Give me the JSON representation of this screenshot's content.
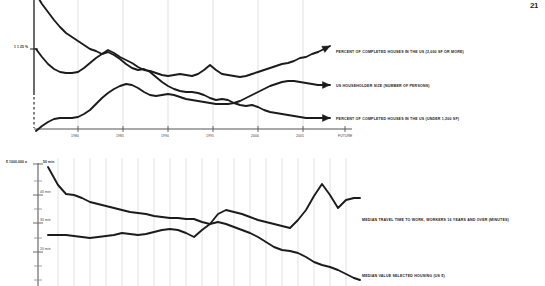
{
  "page": {
    "corner_mark": "21",
    "background": "#ffffff",
    "ink": "#1b1b1b",
    "grid_color": "#cfcfcf"
  },
  "chart_data": [
    {
      "id": "top",
      "type": "line",
      "title": "",
      "xlabel": "",
      "ylabel": "",
      "grid": true,
      "legend_position": "right",
      "axis": {
        "y_note": "1 1 25 %",
        "x_ticks": [
          "1980",
          "1985",
          "1990",
          "1995",
          "2000",
          "2005",
          "FUTURE"
        ],
        "x_tick_positions": [
          78,
          123,
          168,
          213,
          258,
          303,
          345
        ],
        "x_range": [
          34,
          352
        ],
        "y_range": [
          0,
          132
        ],
        "gridline_x": [
          78,
          123,
          168,
          213,
          258,
          303
        ]
      },
      "series": [
        {
          "name": "PERCENT OF COMPLETED HOUSES IN THE US (2,000 SF OR MORE)",
          "legend_y": 51,
          "points": [
            [
              36,
              -6
            ],
            [
              42,
              4
            ],
            [
              48,
              12
            ],
            [
              54,
              20
            ],
            [
              60,
              27
            ],
            [
              66,
              33
            ],
            [
              72,
              37
            ],
            [
              78,
              41
            ],
            [
              84,
              45
            ],
            [
              90,
              49
            ],
            [
              96,
              51
            ],
            [
              102,
              54
            ],
            [
              108,
              50
            ],
            [
              114,
              53
            ],
            [
              120,
              57
            ],
            [
              126,
              60
            ],
            [
              132,
              63
            ],
            [
              138,
              67
            ],
            [
              144,
              70
            ],
            [
              150,
              71
            ],
            [
              156,
              73
            ],
            [
              162,
              75
            ],
            [
              168,
              76
            ],
            [
              174,
              75
            ],
            [
              180,
              74
            ],
            [
              186,
              75
            ],
            [
              192,
              76
            ],
            [
              198,
              74
            ],
            [
              204,
              70
            ],
            [
              210,
              65
            ],
            [
              216,
              70
            ],
            [
              222,
              74
            ],
            [
              228,
              75
            ],
            [
              234,
              76
            ],
            [
              240,
              77
            ],
            [
              246,
              76
            ],
            [
              252,
              74
            ],
            [
              258,
              72
            ],
            [
              264,
              70
            ],
            [
              270,
              68
            ],
            [
              276,
              66
            ],
            [
              282,
              64
            ],
            [
              288,
              63
            ],
            [
              294,
              61
            ],
            [
              300,
              58
            ],
            [
              306,
              57
            ],
            [
              312,
              54
            ],
            [
              318,
              52
            ]
          ],
          "arrow_at": [
            330,
            46
          ]
        },
        {
          "name": "US HOUSEHOLDER SIZE (NUMBER OF PERSONS)",
          "legend_y": 85,
          "points": [
            [
              36,
              131
            ],
            [
              42,
              126
            ],
            [
              48,
              122
            ],
            [
              54,
              119
            ],
            [
              60,
              118
            ],
            [
              66,
              118
            ],
            [
              72,
              118
            ],
            [
              78,
              117
            ],
            [
              84,
              114
            ],
            [
              90,
              110
            ],
            [
              96,
              104
            ],
            [
              102,
              98
            ],
            [
              108,
              93
            ],
            [
              114,
              89
            ],
            [
              120,
              86
            ],
            [
              126,
              84
            ],
            [
              132,
              85
            ],
            [
              138,
              88
            ],
            [
              144,
              92
            ],
            [
              150,
              95
            ],
            [
              156,
              96
            ],
            [
              162,
              95
            ],
            [
              168,
              94
            ],
            [
              174,
              95
            ],
            [
              180,
              97
            ],
            [
              186,
              99
            ],
            [
              192,
              100
            ],
            [
              198,
              101
            ],
            [
              204,
              102
            ],
            [
              210,
              103
            ],
            [
              216,
              104
            ],
            [
              222,
              104
            ],
            [
              228,
              104
            ],
            [
              234,
              103
            ],
            [
              240,
              101
            ],
            [
              246,
              98
            ],
            [
              252,
              95
            ],
            [
              258,
              92
            ],
            [
              264,
              89
            ],
            [
              270,
              86
            ],
            [
              276,
              84
            ],
            [
              282,
              82
            ],
            [
              288,
              81
            ],
            [
              294,
              81
            ],
            [
              300,
              82
            ],
            [
              306,
              83
            ],
            [
              312,
              84
            ],
            [
              318,
              85
            ]
          ],
          "arrow_at": [
            330,
            85
          ]
        },
        {
          "name": "PERCENT OF COMPLETED HOUSES IN THE US (UNDER 1,200 SF)",
          "legend_y": 118,
          "points": [
            [
              36,
              49
            ],
            [
              42,
              57
            ],
            [
              48,
              64
            ],
            [
              54,
              69
            ],
            [
              60,
              72
            ],
            [
              66,
              73
            ],
            [
              72,
              73
            ],
            [
              78,
              72
            ],
            [
              84,
              68
            ],
            [
              90,
              63
            ],
            [
              96,
              58
            ],
            [
              102,
              54
            ],
            [
              108,
              52
            ],
            [
              114,
              55
            ],
            [
              120,
              59
            ],
            [
              126,
              64
            ],
            [
              132,
              68
            ],
            [
              138,
              70
            ],
            [
              144,
              69
            ],
            [
              150,
              72
            ],
            [
              156,
              77
            ],
            [
              162,
              82
            ],
            [
              168,
              86
            ],
            [
              174,
              89
            ],
            [
              180,
              91
            ],
            [
              186,
              92
            ],
            [
              192,
              92
            ],
            [
              198,
              93
            ],
            [
              204,
              95
            ],
            [
              210,
              98
            ],
            [
              216,
              100
            ],
            [
              222,
              99
            ],
            [
              228,
              100
            ],
            [
              234,
              103
            ],
            [
              240,
              105
            ],
            [
              246,
              106
            ],
            [
              252,
              105
            ],
            [
              258,
              107
            ],
            [
              264,
              110
            ],
            [
              270,
              112
            ],
            [
              276,
              113
            ],
            [
              282,
              114
            ],
            [
              288,
              115
            ],
            [
              294,
              116
            ],
            [
              300,
              117
            ],
            [
              306,
              118
            ],
            [
              312,
              118
            ],
            [
              318,
              118
            ]
          ],
          "arrow_at": [
            330,
            118
          ]
        }
      ]
    },
    {
      "id": "bottom",
      "type": "line",
      "title": "",
      "xlabel": "",
      "ylabel": "",
      "grid": true,
      "legend_position": "right",
      "axis": {
        "y_note_left": "$ 1000,000 a",
        "y_note_right": "50 min",
        "y_ticks": [
          "40 min",
          "30 min",
          "20 min"
        ],
        "y_tick_positions": [
          45,
          73,
          102
        ],
        "y_minor_positions": [
          31,
          59,
          88,
          116,
          130
        ],
        "x_range": [
          38,
          360
        ],
        "y_range": [
          14,
          136
        ],
        "gridline_x": [
          58,
          74,
          90,
          106,
          122,
          138,
          154,
          170,
          186,
          202,
          218,
          234,
          250,
          266,
          282,
          298,
          314,
          330,
          346
        ]
      },
      "series": [
        {
          "name": "MEDIAN TRAVEL TIME TO WORK, WORKERS 16 YEARS AND OVER (MINUTES)",
          "legend_y": 219,
          "points": [
            [
              48,
              17
            ],
            [
              58,
              35
            ],
            [
              66,
              44
            ],
            [
              74,
              45
            ],
            [
              82,
              48
            ],
            [
              90,
              52
            ],
            [
              98,
              54
            ],
            [
              106,
              56
            ],
            [
              114,
              58
            ],
            [
              122,
              60
            ],
            [
              130,
              62
            ],
            [
              138,
              63
            ],
            [
              146,
              64
            ],
            [
              154,
              66
            ],
            [
              162,
              67
            ],
            [
              170,
              68
            ],
            [
              178,
              68
            ],
            [
              186,
              69
            ],
            [
              194,
              69
            ],
            [
              202,
              72
            ],
            [
              210,
              74
            ],
            [
              218,
              64
            ],
            [
              226,
              60
            ],
            [
              234,
              62
            ],
            [
              242,
              64
            ],
            [
              250,
              67
            ],
            [
              258,
              70
            ],
            [
              266,
              72
            ],
            [
              274,
              74
            ],
            [
              282,
              76
            ],
            [
              290,
              78
            ],
            [
              298,
              70
            ],
            [
              306,
              60
            ],
            [
              314,
              46
            ],
            [
              322,
              34
            ],
            [
              330,
              45
            ],
            [
              338,
              58
            ],
            [
              346,
              50
            ],
            [
              354,
              48
            ]
          ],
          "arrow_at": [
            360,
            48
          ]
        },
        {
          "name": "MEDIAN VALUE SELECTED HOUSING (US $)",
          "legend_y": 275,
          "points": [
            [
              48,
              85
            ],
            [
              58,
              85
            ],
            [
              66,
              85
            ],
            [
              74,
              86
            ],
            [
              82,
              87
            ],
            [
              90,
              88
            ],
            [
              98,
              87
            ],
            [
              106,
              86
            ],
            [
              114,
              85
            ],
            [
              122,
              83
            ],
            [
              130,
              84
            ],
            [
              138,
              85
            ],
            [
              146,
              84
            ],
            [
              154,
              82
            ],
            [
              162,
              80
            ],
            [
              170,
              79
            ],
            [
              178,
              80
            ],
            [
              186,
              83
            ],
            [
              194,
              87
            ],
            [
              202,
              80
            ],
            [
              210,
              74
            ],
            [
              218,
              72
            ],
            [
              226,
              74
            ],
            [
              234,
              77
            ],
            [
              242,
              80
            ],
            [
              250,
              83
            ],
            [
              258,
              87
            ],
            [
              266,
              92
            ],
            [
              274,
              97
            ],
            [
              282,
              100
            ],
            [
              290,
              101
            ],
            [
              298,
              103
            ],
            [
              306,
              107
            ],
            [
              314,
              112
            ],
            [
              322,
              115
            ],
            [
              330,
              117
            ],
            [
              338,
              120
            ],
            [
              346,
              124
            ],
            [
              354,
              128
            ]
          ],
          "arrow_at": [
            360,
            130
          ]
        }
      ]
    }
  ]
}
